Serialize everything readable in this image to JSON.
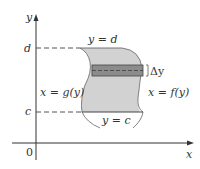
{
  "diagram": {
    "axes": {
      "x_label": "x",
      "y_label": "y",
      "origin_label": "0"
    },
    "levels": {
      "top": "d",
      "bottom": "c"
    },
    "boundary_labels": {
      "top": "y = d",
      "bottom": "y = c",
      "left": "x = g(y)",
      "right": "x = f(y)"
    },
    "strip_label": "Δy",
    "colors": {
      "region_fill": "#cfcfcf",
      "strip_fill": "#8a8a8a",
      "curve": "#555555",
      "axis": "#333333"
    }
  }
}
